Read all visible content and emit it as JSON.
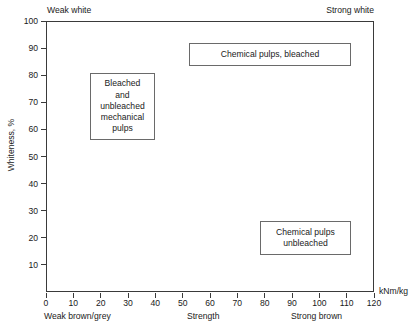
{
  "chart_data": {
    "type": "scatter",
    "title": "",
    "subtitle": "",
    "xlabel": "Strength",
    "ylabel": "Whiteness, %",
    "xunit": "kNm/kg",
    "xlim": [
      0,
      120
    ],
    "ylim": [
      0,
      100
    ],
    "grid": false,
    "legend_position": "none",
    "x_ticks": [
      0,
      10,
      20,
      30,
      40,
      50,
      60,
      70,
      80,
      90,
      100,
      110,
      120
    ],
    "x_tick_labels": [
      "0",
      "10",
      "20",
      "30",
      "40",
      "50",
      "60",
      "70",
      "80",
      "90",
      "100",
      "110",
      "120"
    ],
    "y_ticks": [
      10,
      20,
      30,
      40,
      50,
      60,
      70,
      80,
      90,
      100
    ],
    "y_tick_labels": [
      "10",
      "20",
      "30",
      "40",
      "50",
      "60",
      "70",
      "80",
      "90",
      "100"
    ],
    "corner_annotations": {
      "top_left": "Weak white",
      "top_right": "Strong white",
      "bottom_left": "Weak brown/grey",
      "bottom_center": "Strength",
      "bottom_right": "Strong brown"
    },
    "regions": [
      {
        "name": "chemical-pulps-bleached",
        "label": "Chemical pulps, bleached",
        "lines": [
          "Chemical pulps, bleached"
        ],
        "x_range": [
          52,
          112
        ],
        "y_range": [
          81,
          90
        ]
      },
      {
        "name": "mechanical-pulps",
        "label": "Bleached and unbleached mechanical pulps",
        "lines": [
          "Bleached",
          "and",
          "unbleached",
          "mechanical",
          "pulps"
        ],
        "x_range": [
          16,
          40
        ],
        "y_range": [
          56,
          81
        ]
      },
      {
        "name": "chemical-pulps-unbleached",
        "label": "Chemical pulps unbleached",
        "lines": [
          "Chemical pulps",
          "unbleached"
        ],
        "x_range": [
          78,
          112
        ],
        "y_range": [
          14,
          27
        ]
      }
    ]
  },
  "axis": {
    "y_title": "Whiteness, %",
    "x_unit": "kNm/kg"
  },
  "colors": {
    "axis": "#3a3a3a",
    "box_border": "#6a6a6a",
    "text": "#1a1a1a",
    "background": "#ffffff"
  }
}
